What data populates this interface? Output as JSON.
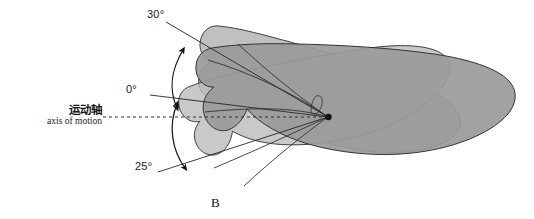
{
  "figure": {
    "panel_letter": "B",
    "background_color": "#ffffff",
    "outline_color": "#3a3a3a",
    "pivot_color": "#111111"
  },
  "axis": {
    "label_cn": "运动轴",
    "label_en": "axis of motion",
    "line_style": "dashed",
    "line_color": "#333333"
  },
  "angles": [
    {
      "id": "upper",
      "label": "30°",
      "value": 30,
      "direction": "up"
    },
    {
      "id": "neutral",
      "label": "0°",
      "value": 0,
      "direction": "horizontal"
    },
    {
      "id": "lower",
      "label": "25°",
      "value": 25,
      "direction": "down"
    }
  ],
  "shapes": [
    {
      "id": "body-neutral",
      "fill": "#9a9a9a",
      "label": "neutral-position-body"
    },
    {
      "id": "body-rotated-up",
      "fill": "#b7b7b7",
      "label": "rotated-up-30-body"
    },
    {
      "id": "body-rotated-down",
      "fill": "#b2b2b2",
      "label": "rotated-down-25-body"
    }
  ],
  "arcs": [
    {
      "id": "arc-upper",
      "label": "range-of-motion-arc-upper"
    },
    {
      "id": "arc-lower",
      "label": "range-of-motion-arc-lower"
    }
  ]
}
